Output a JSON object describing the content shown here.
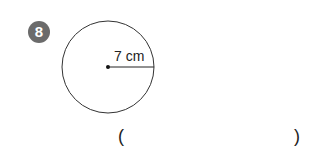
{
  "problem": {
    "number": "8",
    "radius_label": "7 cm",
    "answer_open": "(",
    "answer_close": ")",
    "answer_value": ""
  },
  "colors": {
    "badge": "#6b6b6b",
    "line": "#333333"
  }
}
